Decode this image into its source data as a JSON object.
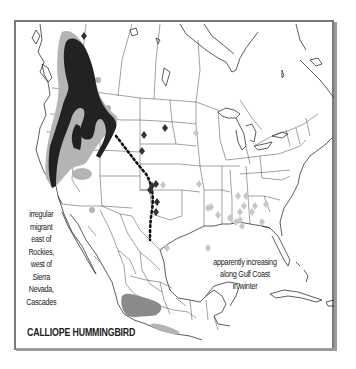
{
  "map": {
    "title": "CALLIOPE HUMMINGBIRD",
    "annotations": {
      "west_migrant": {
        "lines": [
          "irregular",
          "migrant",
          "east of",
          "Rockies,",
          "west of",
          "Sierra",
          "Nevada,",
          "Cascades"
        ]
      },
      "gulf_coast": {
        "lines": [
          "apparently increasing",
          "along Gulf Coast",
          "in winter"
        ]
      }
    },
    "legend_colors": {
      "summer_range": "#222222",
      "migration_range": "#b4b4b4",
      "winter_range": "#8a8a8a",
      "vagrant_summer": "#333333",
      "vagrant_winter": "#c8c8c8",
      "frame": "#7a7a7a",
      "borders": "#333333"
    }
  }
}
